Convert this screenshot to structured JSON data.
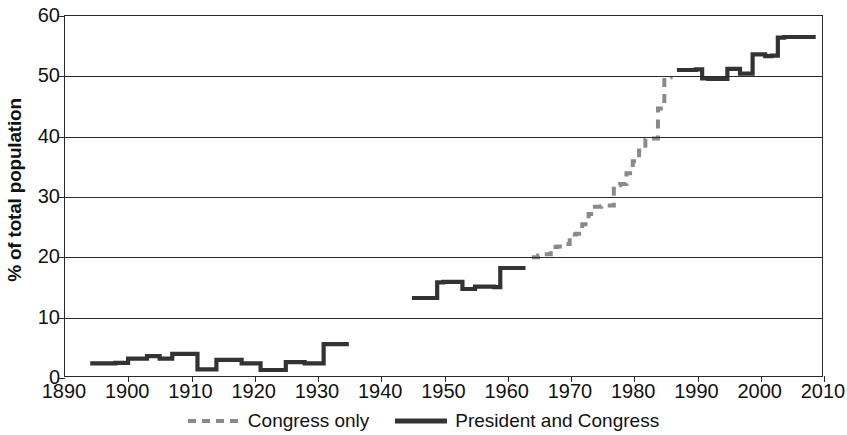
{
  "chart_data": {
    "type": "line",
    "title": "",
    "xlabel": "",
    "ylabel": "% of total population",
    "xlim": [
      1890,
      2010
    ],
    "ylim": [
      0,
      60
    ],
    "xticks": [
      1890,
      1900,
      1910,
      1920,
      1930,
      1940,
      1950,
      1960,
      1970,
      1980,
      1990,
      2000,
      2010
    ],
    "yticks": [
      0,
      10,
      20,
      30,
      40,
      50,
      60
    ],
    "grid": "horizontal",
    "legend_position": "bottom",
    "series": [
      {
        "name": "Congress only",
        "style": "dashed",
        "color": "#8a8a8a",
        "x": [
          1964,
          1965,
          1966,
          1967,
          1968,
          1969,
          1970,
          1971,
          1972,
          1973,
          1974,
          1975,
          1976,
          1977,
          1978,
          1979,
          1980,
          1981,
          1982,
          1983,
          1984,
          1985,
          1986
        ],
        "values": [
          19.8,
          20.1,
          20.3,
          21.5,
          21.6,
          22.0,
          23.6,
          23.7,
          25.3,
          27.0,
          28.2,
          28.3,
          28.4,
          31.8,
          32.0,
          33.8,
          35.8,
          37.6,
          39.5,
          39.6,
          44.6,
          49.8,
          50.0
        ]
      },
      {
        "name": "President and Congress",
        "style": "solid",
        "color": "#333333",
        "segments": [
          {
            "x": [
              1894,
              1895,
              1896,
              1897,
              1898,
              1899,
              1900,
              1901,
              1902,
              1903,
              1904,
              1905,
              1906,
              1907,
              1908,
              1909,
              1910,
              1911,
              1912,
              1913,
              1914,
              1915,
              1916,
              1917,
              1918,
              1919,
              1920,
              1921,
              1922,
              1923,
              1924,
              1925,
              1926,
              1927,
              1928,
              1929,
              1930,
              1931,
              1932,
              1933,
              1934,
              1935
            ],
            "values": [
              2.1,
              2.1,
              2.1,
              2.1,
              2.2,
              2.2,
              2.9,
              2.9,
              2.9,
              3.3,
              3.3,
              2.9,
              2.9,
              3.7,
              3.7,
              3.7,
              3.7,
              1.1,
              1.1,
              1.1,
              2.7,
              2.7,
              2.7,
              2.7,
              2.1,
              2.1,
              2.1,
              1.0,
              1.0,
              1.0,
              1.0,
              2.3,
              2.3,
              2.3,
              2.1,
              2.1,
              2.1,
              5.3,
              5.3,
              5.3,
              5.3,
              5.3
            ]
          },
          {
            "x": [
              1945,
              1946,
              1947,
              1948,
              1949,
              1950,
              1951,
              1952,
              1953,
              1954,
              1955,
              1956,
              1957,
              1958,
              1959,
              1960,
              1961,
              1962,
              1963
            ],
            "values": [
              13.0,
              13.0,
              13.0,
              13.0,
              15.6,
              15.7,
              15.7,
              15.7,
              14.5,
              14.5,
              14.9,
              14.9,
              14.9,
              14.8,
              18.0,
              18.0,
              18.0,
              18.0,
              18.0
            ]
          },
          {
            "x": [
              1987,
              1988,
              1989,
              1990,
              1991,
              1992,
              1993,
              1994,
              1995,
              1996,
              1997,
              1998,
              1999,
              2000,
              2001,
              2002,
              2003,
              2004,
              2005,
              2006,
              2007,
              2008,
              2009
            ],
            "values": [
              51.0,
              51.0,
              51.0,
              51.1,
              49.6,
              49.5,
              49.5,
              49.5,
              51.2,
              51.2,
              50.4,
              50.4,
              53.6,
              53.6,
              53.3,
              53.4,
              56.4,
              56.5,
              56.5,
              56.5,
              56.5,
              56.5,
              56.5
            ]
          }
        ]
      }
    ]
  },
  "legend": {
    "items": [
      {
        "label": "Congress only"
      },
      {
        "label": "President and Congress"
      }
    ]
  }
}
